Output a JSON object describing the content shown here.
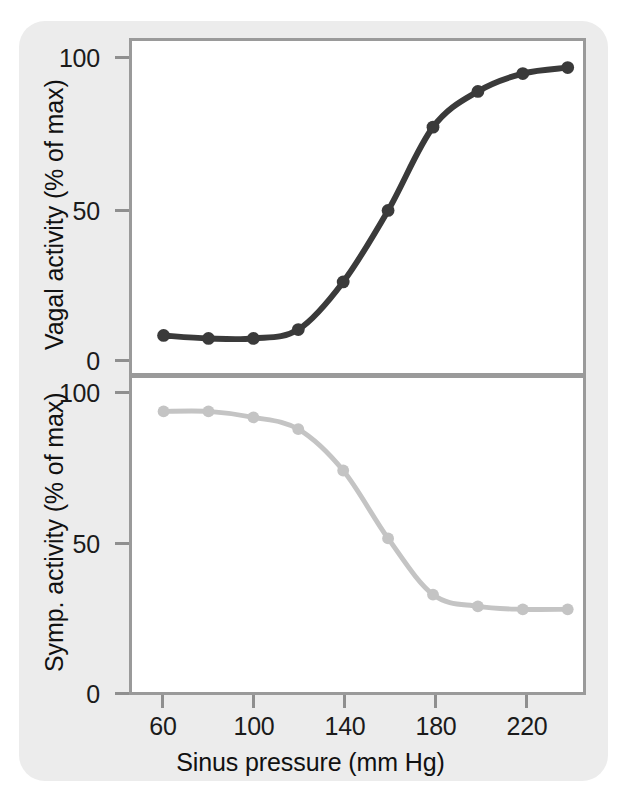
{
  "figure": {
    "background_color": "#ececec",
    "panel_background": "#ffffff",
    "axis_color": "#9a9a9a"
  },
  "axis": {
    "x_label": "Sinus pressure (mm Hg)",
    "x_ticks": [
      "60",
      "100",
      "140",
      "180",
      "220"
    ],
    "y_ticks_top": [
      "100",
      "50",
      "0"
    ],
    "y_ticks_bottom": [
      "100",
      "50",
      "0"
    ],
    "y_label_top": "Vagal activity (% of max)",
    "y_label_bottom": "Symp. activity (% of max)"
  },
  "chart_data": [
    {
      "type": "line",
      "title": "",
      "name": "Vagal activity",
      "xlabel": "Sinus pressure (mm Hg)",
      "ylabel": "Vagal activity (% of max)",
      "xlim": [
        50,
        250
      ],
      "ylim": [
        0,
        108
      ],
      "xticks": [
        60,
        100,
        140,
        180,
        220
      ],
      "yticks": [
        0,
        50,
        100
      ],
      "grid": false,
      "legend": "none",
      "marker": "circle",
      "color": "#3a3a3a",
      "x": [
        60,
        80,
        100,
        120,
        140,
        160,
        180,
        200,
        220,
        240
      ],
      "values": [
        7,
        6,
        6,
        9,
        25,
        49,
        77,
        89,
        95,
        97
      ]
    },
    {
      "type": "line",
      "title": "",
      "name": "Sympathetic activity",
      "xlabel": "Sinus pressure (mm Hg)",
      "ylabel": "Symp. activity (% of max)",
      "xlim": [
        50,
        250
      ],
      "ylim": [
        0,
        100
      ],
      "xticks": [
        60,
        100,
        140,
        180,
        220
      ],
      "yticks": [
        0,
        50,
        100
      ],
      "grid": false,
      "legend": "none",
      "marker": "circle",
      "color": "#c4c4c4",
      "x": [
        60,
        80,
        100,
        120,
        140,
        160,
        180,
        200,
        220,
        240
      ],
      "values": [
        94,
        94,
        92,
        88,
        74,
        51,
        32,
        28,
        27,
        27
      ]
    }
  ]
}
